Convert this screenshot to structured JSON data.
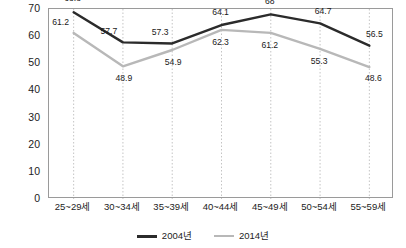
{
  "chart_data": {
    "type": "line",
    "title": "",
    "xlabel": "",
    "ylabel": "",
    "ylim": [
      0,
      70
    ],
    "ytick_step": 10,
    "yticks": [
      "0",
      "10",
      "20",
      "30",
      "40",
      "50",
      "60",
      "70"
    ],
    "grid": "vertical-dotted",
    "legend_position": "bottom-center",
    "categories": [
      "25~29세",
      "30~34세",
      "35~39세",
      "40~44세",
      "45~49세",
      "50~54세",
      "55~59세"
    ],
    "series": [
      {
        "name": "2004년",
        "color": "#2b2b2b",
        "values": [
          68.8,
          57.7,
          57.3,
          64.1,
          68,
          64.7,
          56.5
        ],
        "labels": [
          "68.8",
          "57.7",
          "57.3",
          "64.1",
          "68",
          "64.7",
          "56.5"
        ]
      },
      {
        "name": "2014년",
        "color": "#b8b8b8",
        "values": [
          61.2,
          48.9,
          54.9,
          62.3,
          61.2,
          55.3,
          48.6
        ],
        "labels": [
          "61.2",
          "48.9",
          "54.9",
          "62.3",
          "61.2",
          "55.3",
          "48.6"
        ]
      }
    ]
  },
  "colors": {
    "series_2004": "#2b2b2b",
    "series_2014": "#b8b8b8",
    "plot_border": "#9a9a9a",
    "gridline": "#c4c4c4",
    "background": "#ffffff",
    "text": "#1c1c1c"
  },
  "legend": {
    "items": [
      {
        "label": "2004년",
        "color": "#2b2b2b"
      },
      {
        "label": "2014년",
        "color": "#b8b8b8"
      }
    ]
  }
}
